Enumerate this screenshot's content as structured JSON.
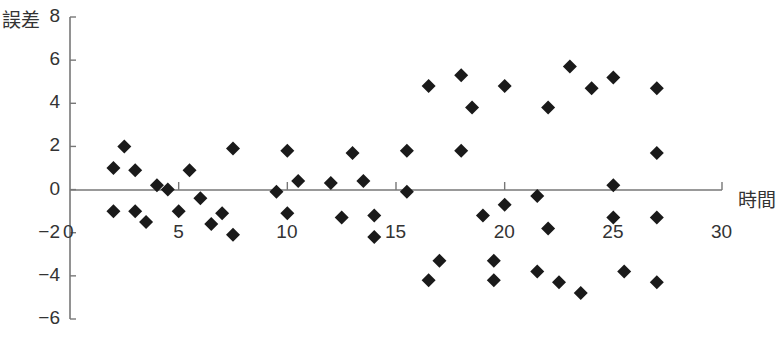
{
  "chart_data": {
    "type": "scatter",
    "title": "",
    "xlabel": "時間",
    "ylabel": "誤差",
    "xlim": [
      0,
      30
    ],
    "ylim": [
      -6,
      8
    ],
    "xticks": [
      0,
      5,
      10,
      15,
      20,
      25,
      30
    ],
    "yticks": [
      -6,
      -4,
      -2,
      0,
      2,
      4,
      6,
      8
    ],
    "xtick_labels": [
      "0",
      "5",
      "10",
      "15",
      "20",
      "25",
      "30"
    ],
    "ytick_labels": [
      "−6",
      "−4",
      "−2",
      "0",
      "2",
      "4",
      "6",
      "8"
    ],
    "grid": false,
    "legend": null,
    "marker": "diamond",
    "marker_color": "#1a1a1a",
    "series": [
      {
        "name": "誤差",
        "points": [
          [
            2.0,
            1.0
          ],
          [
            2.0,
            -1.0
          ],
          [
            2.5,
            2.0
          ],
          [
            3.0,
            0.9
          ],
          [
            3.0,
            -1.0
          ],
          [
            3.5,
            -1.5
          ],
          [
            4.0,
            0.2
          ],
          [
            4.5,
            0.0
          ],
          [
            5.0,
            -1.0
          ],
          [
            5.5,
            0.9
          ],
          [
            6.0,
            -0.4
          ],
          [
            6.5,
            -1.6
          ],
          [
            7.0,
            -1.1
          ],
          [
            7.5,
            1.9
          ],
          [
            7.5,
            -2.1
          ],
          [
            9.5,
            -0.1
          ],
          [
            10.0,
            1.8
          ],
          [
            10.0,
            -1.1
          ],
          [
            10.5,
            0.4
          ],
          [
            12.0,
            0.3
          ],
          [
            12.5,
            -1.3
          ],
          [
            13.0,
            1.7
          ],
          [
            13.5,
            0.4
          ],
          [
            14.0,
            -1.2
          ],
          [
            14.0,
            -2.2
          ],
          [
            15.5,
            1.8
          ],
          [
            15.5,
            -0.1
          ],
          [
            16.5,
            4.8
          ],
          [
            16.5,
            -4.2
          ],
          [
            17.0,
            -3.3
          ],
          [
            18.0,
            5.3
          ],
          [
            18.0,
            1.8
          ],
          [
            18.5,
            3.8
          ],
          [
            19.0,
            -1.2
          ],
          [
            19.5,
            -3.3
          ],
          [
            19.5,
            -4.2
          ],
          [
            20.0,
            4.8
          ],
          [
            20.0,
            -0.7
          ],
          [
            21.5,
            -0.3
          ],
          [
            21.5,
            -3.8
          ],
          [
            22.0,
            3.8
          ],
          [
            22.0,
            -1.8
          ],
          [
            22.5,
            -4.3
          ],
          [
            23.0,
            5.7
          ],
          [
            23.5,
            -4.8
          ],
          [
            24.0,
            4.7
          ],
          [
            25.0,
            5.2
          ],
          [
            25.0,
            0.2
          ],
          [
            25.0,
            -1.3
          ],
          [
            25.5,
            -3.8
          ],
          [
            27.0,
            4.7
          ],
          [
            27.0,
            1.7
          ],
          [
            27.0,
            -1.3
          ],
          [
            27.0,
            -4.3
          ]
        ]
      }
    ]
  },
  "axes": {
    "ylabel": "誤差",
    "xlabel": "時間"
  }
}
